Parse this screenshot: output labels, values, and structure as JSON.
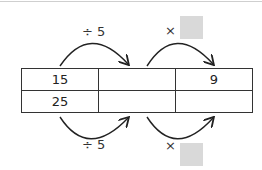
{
  "table": {
    "rows": [
      [
        "15",
        "",
        "9"
      ],
      [
        "25",
        "",
        ""
      ]
    ]
  },
  "operators": {
    "top_left": "÷ 5",
    "top_right": "×",
    "bottom_left": "÷ 5",
    "bottom_right": "×"
  },
  "colors": {
    "blank_box": "#d9d9d9",
    "line": "#333333"
  }
}
